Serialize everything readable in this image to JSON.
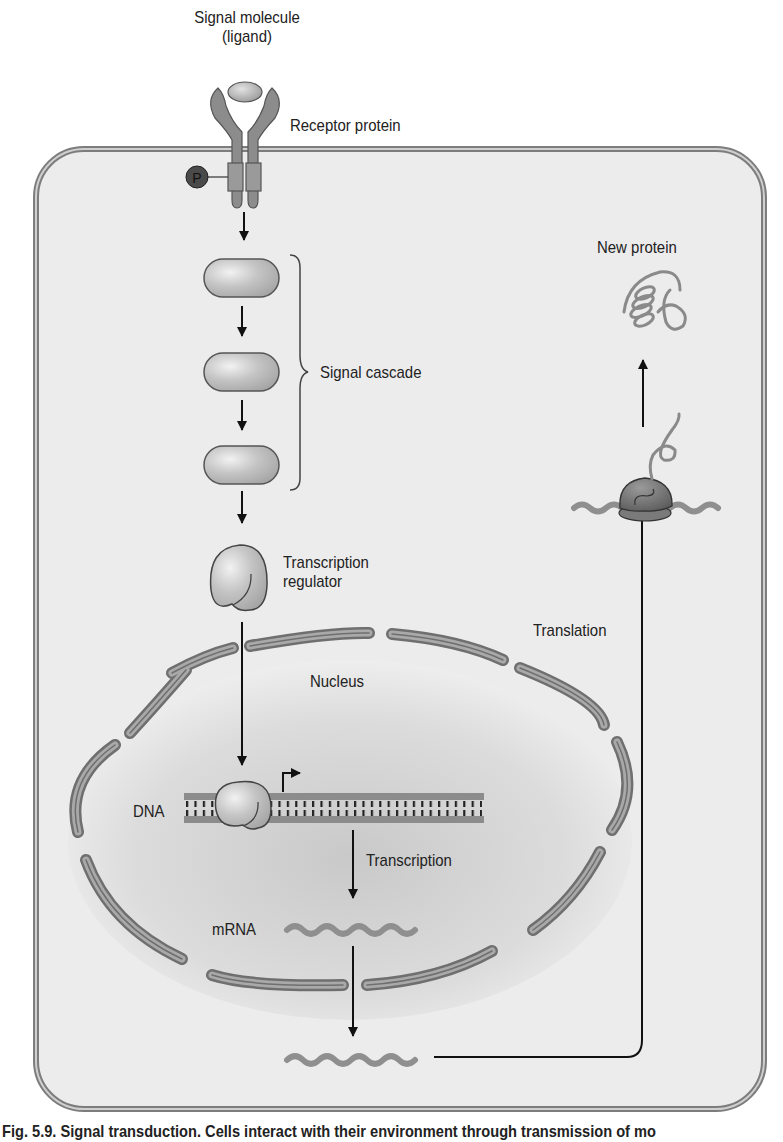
{
  "figure": {
    "caption": "Fig. 5.9. Signal transduction. Cells interact with their environment through transmission of mo",
    "labels": {
      "signal_molecule_line1": "Signal molecule",
      "signal_molecule_line2": "(ligand)",
      "receptor_protein": "Receptor protein",
      "phosphate": "P",
      "signal_cascade": "Signal cascade",
      "transcription_regulator_line1": "Transcription",
      "transcription_regulator_line2": "regulator",
      "nucleus": "Nucleus",
      "dna": "DNA",
      "transcription": "Transcription",
      "mrna": "mRNA",
      "translation": "Translation",
      "new_protein": "New protein"
    },
    "colors": {
      "cytoplasm": "#ececec",
      "membrane": "#8a8a8a",
      "protein_fill": "#b8b8b8",
      "protein_dark": "#6e6e6e",
      "nucleus_center": "#cfcfcf",
      "rna": "#8f8f8f",
      "arrow": "#111111",
      "phosphate": "#4a4a4a"
    },
    "pathway_steps": [
      "Signal molecule (ligand) binds receptor protein",
      "Receptor phosphorylation (P)",
      "Signal cascade (3 proteins)",
      "Transcription regulator",
      "Nucleus: binds DNA",
      "Transcription to mRNA",
      "mRNA exported",
      "Translation at ribosome",
      "New protein"
    ]
  }
}
